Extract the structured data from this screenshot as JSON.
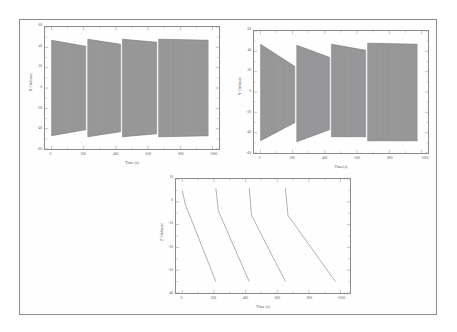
{
  "figure": {
    "panel_count": 3,
    "border_color": "#8d8d90",
    "trace_color": "#6f6f72",
    "background": "#ffffff"
  },
  "chart_data": [
    {
      "id": "x-ordinate-panel",
      "type": "line",
      "title": "",
      "xlabel": "Time (s)",
      "ylabel": "X-Ordinate",
      "xlim": [
        -40,
        1040
      ],
      "ylim": [
        -60,
        60
      ],
      "xticks": [
        0,
        200,
        400,
        600,
        800,
        1000
      ],
      "yticks": [
        60,
        40,
        20,
        0,
        -20,
        -40,
        -60
      ],
      "xtick_labels": [
        "0",
        "200",
        "400",
        "600",
        "800",
        "1000"
      ],
      "ytick_labels": [
        "60",
        "40",
        "20",
        "0",
        "-20",
        "-40",
        "-60"
      ],
      "grid": false,
      "legend": "none",
      "description": "Dense high-frequency oscillation in four repeating bursts; within each burst the envelope decays linearly then resets.",
      "bursts": [
        {
          "t_start": 0,
          "t_end": 215,
          "env_start": 47,
          "env_end": 41
        },
        {
          "t_start": 225,
          "t_end": 430,
          "env_start": 48,
          "env_end": 43
        },
        {
          "t_start": 440,
          "t_end": 655,
          "env_start": 48,
          "env_end": 45
        },
        {
          "t_start": 665,
          "t_end": 975,
          "env_start": 48,
          "env_end": 47
        }
      ],
      "envelope_symmetric": true,
      "oscillation_period": 2.2
    },
    {
      "id": "y-ordinate-panel",
      "type": "line",
      "title": "",
      "xlabel": "Time(s)",
      "ylabel": "Y-Ordinate",
      "xlim": [
        -40,
        1040
      ],
      "ylim": [
        -60,
        60
      ],
      "xticks": [
        0,
        200,
        400,
        600,
        800,
        1000
      ],
      "yticks": [
        60,
        40,
        20,
        0,
        -20,
        -40,
        -60
      ],
      "xtick_labels": [
        "0",
        "200",
        "400",
        "600",
        "800",
        "1000"
      ],
      "ytick_labels": [
        "60",
        "40",
        "20",
        "0",
        "-20",
        "-40",
        "-60"
      ],
      "grid": false,
      "legend": "none",
      "description": "Dense high-frequency oscillation in four repeating bursts with asymmetric decaying envelope; upper bound falls while lower bound rises within each burst.",
      "bursts": [
        {
          "t_start": 0,
          "t_end": 215,
          "upper_start": 47,
          "upper_end": 25,
          "lower_start": -48,
          "lower_end": -30
        },
        {
          "t_start": 225,
          "t_end": 430,
          "upper_start": 46,
          "upper_end": 34,
          "lower_start": -49,
          "lower_end": -37
        },
        {
          "t_start": 440,
          "t_end": 655,
          "upper_start": 47,
          "upper_end": 41,
          "lower_start": -44,
          "lower_end": -44
        },
        {
          "t_start": 665,
          "t_end": 975,
          "upper_start": 48,
          "upper_end": 47,
          "lower_start": -48,
          "lower_end": -48
        }
      ],
      "envelope_symmetric": false,
      "oscillation_period": 2.2
    },
    {
      "id": "z-ordinate-panel",
      "type": "line",
      "title": "",
      "xlabel": "Time (s)",
      "ylabel": "Z-Ordinate",
      "xlim": [
        -40,
        1060
      ],
      "ylim": [
        -40,
        10
      ],
      "xticks": [
        0,
        200,
        400,
        600,
        800,
        1000
      ],
      "yticks": [
        10,
        0,
        -10,
        -20,
        -30,
        -40
      ],
      "xtick_labels": [
        "0",
        "200",
        "400",
        "600",
        "800",
        "1000"
      ],
      "ytick_labels": [
        "10",
        "0",
        "-10",
        "-20",
        "-30",
        "-40"
      ],
      "grid": false,
      "legend": "none",
      "description": "Sawtooth ramp: value descends steadily then resets upward, four full teeth across the record.",
      "sawtooth": [
        {
          "t_start": 0,
          "y_start": 5,
          "t_knee": 18,
          "y_knee": -1,
          "t_end": 212,
          "y_end": -35
        },
        {
          "t_start": 212,
          "y_start": 6,
          "t_knee": 228,
          "y_knee": -4,
          "t_end": 423,
          "y_end": -35
        },
        {
          "t_start": 423,
          "y_start": 6,
          "t_knee": 438,
          "y_knee": -6,
          "t_end": 652,
          "y_end": -35
        },
        {
          "t_start": 652,
          "y_start": 6,
          "t_knee": 668,
          "y_knee": -6,
          "t_end": 968,
          "y_end": -35
        }
      ]
    }
  ]
}
